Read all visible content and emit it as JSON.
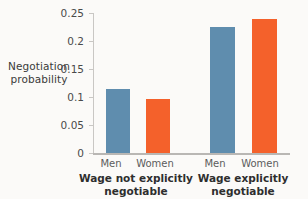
{
  "chart_data": {
    "type": "bar",
    "title": "",
    "subtitle": "",
    "xlabel": "",
    "ylabel": "Negotiation probability",
    "ylabel_lines": [
      "Negotiation",
      "probability"
    ],
    "ylim": [
      0,
      0.25
    ],
    "yticks": [
      0,
      0.05,
      0.1,
      0.15,
      0.2,
      0.25
    ],
    "ytick_labels": [
      "0",
      "0.05",
      "0.1",
      "0.15",
      "0.2",
      "0.25"
    ],
    "grid": false,
    "legend": "none",
    "categories": [
      "Men",
      "Women"
    ],
    "groups": [
      {
        "label": "Wage not explicitly negotiable",
        "label_lines": [
          "Wage not explicitly",
          "negotiable"
        ],
        "bars": [
          {
            "category": "Men",
            "value": 0.115,
            "color": "#5f8dae"
          },
          {
            "category": "Women",
            "value": 0.096,
            "color": "#f4612b"
          }
        ]
      },
      {
        "label": "Wage explicitly negotiable",
        "label_lines": [
          "Wage explicitly",
          "negotiable"
        ],
        "bars": [
          {
            "category": "Men",
            "value": 0.225,
            "color": "#5f8dae"
          },
          {
            "category": "Women",
            "value": 0.24,
            "color": "#f4612b"
          }
        ]
      }
    ],
    "series": [
      {
        "name": "Men",
        "values": [
          0.115,
          0.225
        ],
        "color": "#5f8dae"
      },
      {
        "name": "Women",
        "values": [
          0.096,
          0.24
        ],
        "color": "#f4612b"
      }
    ],
    "colors": {
      "men": "#5f8dae",
      "women": "#f4612b",
      "axis": "#c9c7c4",
      "background": "#fbfaf8",
      "text": "#3a3a3a"
    }
  }
}
